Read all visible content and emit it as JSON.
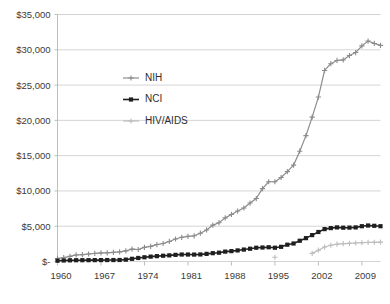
{
  "chart_data": {
    "type": "line",
    "title": "",
    "subtitle": "",
    "xlabel": "",
    "ylabel": "",
    "xlim": [
      1960,
      2012
    ],
    "ylim": [
      0,
      35000
    ],
    "grid": true,
    "legend_position": "inside-upper-left",
    "y_tick_labels": [
      "$35,000",
      "$30,000",
      "$25,000",
      "$20,000",
      "$15,000",
      "$10,000",
      "$5,000",
      "$-"
    ],
    "y_tick_values": [
      35000,
      30000,
      25000,
      20000,
      15000,
      10000,
      5000,
      0
    ],
    "x_tick_labels": [
      "1960",
      "1967",
      "1974",
      "1981",
      "1988",
      "1995",
      "2002",
      "2009"
    ],
    "x_tick_values": [
      1960,
      1967,
      1974,
      1981,
      1988,
      1995,
      2002,
      2009
    ],
    "x": [
      1960,
      1961,
      1962,
      1963,
      1964,
      1965,
      1966,
      1967,
      1968,
      1969,
      1970,
      1971,
      1972,
      1973,
      1974,
      1975,
      1976,
      1977,
      1978,
      1979,
      1980,
      1981,
      1982,
      1983,
      1984,
      1985,
      1986,
      1987,
      1988,
      1989,
      1990,
      1991,
      1992,
      1993,
      1994,
      1995,
      1996,
      1997,
      1998,
      1999,
      2000,
      2001,
      2002,
      2003,
      2004,
      2005,
      2006,
      2007,
      2008,
      2009,
      2010,
      2011,
      2012
    ],
    "series": [
      {
        "name": "NIH",
        "color": "#8c8c8c",
        "marker": "plus",
        "values": [
          430,
          540,
          720,
          930,
          975,
          1060,
          1140,
          1210,
          1230,
          1290,
          1360,
          1500,
          1750,
          1700,
          2000,
          2150,
          2400,
          2550,
          2840,
          3190,
          3430,
          3570,
          3640,
          4010,
          4470,
          5150,
          5500,
          6180,
          6670,
          7150,
          7580,
          8280,
          8920,
          10330,
          11300,
          11300,
          11900,
          12740,
          13650,
          15630,
          17840,
          20460,
          23300,
          27070,
          28030,
          28490,
          28560,
          29180,
          29610,
          30550,
          31240,
          30900,
          30620
        ]
      },
      {
        "name": "NCI",
        "color": "#1f1f1f",
        "marker": "square",
        "values": [
          110,
          145,
          165,
          180,
          185,
          190,
          195,
          200,
          205,
          205,
          215,
          265,
          380,
          500,
          600,
          690,
          760,
          815,
          870,
          940,
          990,
          990,
          980,
          1000,
          1080,
          1180,
          1250,
          1400,
          1470,
          1570,
          1690,
          1810,
          1950,
          1980,
          2020,
          1950,
          2080,
          2380,
          2550,
          2940,
          3310,
          3740,
          4180,
          4590,
          4730,
          4830,
          4790,
          4800,
          4830,
          5000,
          5100,
          5060,
          5000
        ]
      },
      {
        "name": "HIV/AIDS",
        "color": "#bdbdbd",
        "marker": "plus",
        "values": [
          null,
          null,
          null,
          null,
          null,
          null,
          null,
          null,
          null,
          null,
          null,
          null,
          null,
          null,
          null,
          null,
          null,
          null,
          null,
          null,
          null,
          null,
          null,
          null,
          null,
          null,
          null,
          null,
          null,
          null,
          null,
          null,
          null,
          null,
          null,
          600,
          null,
          null,
          null,
          null,
          null,
          1150,
          1600,
          2050,
          2300,
          2450,
          2520,
          2580,
          2620,
          2660,
          2700,
          2720,
          2740
        ]
      }
    ]
  },
  "legend": {
    "items": [
      {
        "label": "NIH"
      },
      {
        "label": "NCI"
      },
      {
        "label": "HIV/AIDS"
      }
    ]
  }
}
